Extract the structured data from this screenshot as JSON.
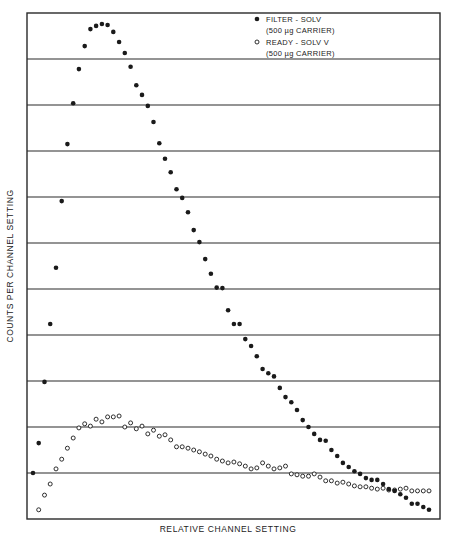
{
  "chart_data": {
    "type": "scatter",
    "title": "",
    "xlabel": "RELATIVE CHANNEL SETTING",
    "ylabel": "COUNTS PER CHANNEL SETTING",
    "grid": {
      "horizontal": true,
      "vertical": false,
      "bands": 11
    },
    "ylim": [
      0,
      11
    ],
    "xlim": [
      0,
      72
    ],
    "legend_position": "top-right",
    "tick_labels": {
      "x": [],
      "y": []
    },
    "series": [
      {
        "name": "FILTER - SOLV",
        "sublabel": "(500 µg CARRIER)",
        "marker": "filled-circle",
        "x": [
          1,
          2,
          3,
          4,
          5,
          6,
          7,
          8,
          9,
          10,
          11,
          12,
          13,
          14,
          15,
          16,
          17,
          18,
          19,
          20,
          21,
          22,
          23,
          24,
          25,
          26,
          27,
          28,
          29,
          30,
          31,
          32,
          33,
          34,
          35,
          36,
          37,
          38,
          39,
          40,
          41,
          42,
          43,
          44,
          45,
          46,
          47,
          48,
          49,
          50,
          51,
          52,
          53,
          54,
          55,
          56,
          57,
          58,
          59,
          60,
          61,
          62,
          63,
          64,
          65,
          66,
          67,
          68,
          69,
          70
        ],
        "values": [
          1.0,
          1.65,
          2.98,
          4.24,
          5.46,
          6.91,
          8.15,
          9.04,
          9.78,
          10.28,
          10.65,
          10.72,
          10.76,
          10.74,
          10.59,
          10.37,
          10.13,
          9.83,
          9.43,
          9.22,
          8.98,
          8.63,
          8.17,
          7.83,
          7.54,
          7.17,
          6.98,
          6.67,
          6.28,
          6.02,
          5.65,
          5.33,
          5.03,
          5.02,
          4.54,
          4.24,
          4.24,
          3.91,
          3.76,
          3.54,
          3.26,
          3.17,
          3.1,
          2.85,
          2.65,
          2.54,
          2.37,
          2.15,
          2.0,
          1.85,
          1.72,
          1.7,
          1.5,
          1.37,
          1.22,
          1.13,
          1.04,
          0.98,
          0.89,
          0.85,
          0.85,
          0.76,
          0.65,
          0.61,
          0.54,
          0.46,
          0.33,
          0.33,
          0.26,
          0.2
        ]
      },
      {
        "name": "READY - SOLV V",
        "sublabel": "(500 µg CARRIER)",
        "marker": "open-circle",
        "x": [
          2,
          3,
          4,
          5,
          6,
          7,
          8,
          9,
          10,
          11,
          12,
          13,
          14,
          15,
          16,
          17,
          18,
          19,
          20,
          21,
          22,
          23,
          24,
          25,
          26,
          27,
          28,
          29,
          30,
          31,
          32,
          33,
          34,
          35,
          36,
          37,
          38,
          39,
          40,
          41,
          42,
          43,
          44,
          45,
          46,
          47,
          48,
          49,
          50,
          51,
          52,
          53,
          54,
          55,
          56,
          57,
          58,
          59,
          60,
          61,
          62,
          63,
          64,
          65,
          66,
          67,
          68,
          69,
          70
        ],
        "values": [
          0.2,
          0.52,
          0.76,
          1.09,
          1.3,
          1.54,
          1.76,
          1.98,
          2.07,
          2.02,
          2.17,
          2.11,
          2.22,
          2.22,
          2.24,
          2.0,
          2.09,
          1.96,
          2.02,
          1.85,
          1.93,
          1.8,
          1.83,
          1.72,
          1.57,
          1.57,
          1.54,
          1.5,
          1.46,
          1.41,
          1.37,
          1.3,
          1.26,
          1.22,
          1.24,
          1.2,
          1.15,
          1.09,
          1.11,
          1.22,
          1.15,
          1.09,
          1.11,
          1.15,
          0.98,
          0.96,
          0.93,
          0.93,
          0.98,
          0.91,
          0.83,
          0.83,
          0.78,
          0.8,
          0.76,
          0.72,
          0.7,
          0.7,
          0.67,
          0.65,
          0.67,
          0.63,
          0.63,
          0.65,
          0.67,
          0.61,
          0.61,
          0.61,
          0.61
        ]
      }
    ]
  },
  "legend": {
    "items": [
      {
        "symbol": "●",
        "label": "FILTER - SOLV",
        "sublabel": "(500 µg CARRIER)"
      },
      {
        "symbol": "○",
        "label": "READY - SOLV V",
        "sublabel": "(500 µg CARRIER)"
      }
    ]
  },
  "axes": {
    "x_label": "RELATIVE CHANNEL SETTING",
    "y_label": "COUNTS PER CHANNEL SETTING"
  },
  "colors": {
    "ink": "#1a1a1a",
    "grid": "#2a2a2a",
    "background": "#ffffff"
  }
}
